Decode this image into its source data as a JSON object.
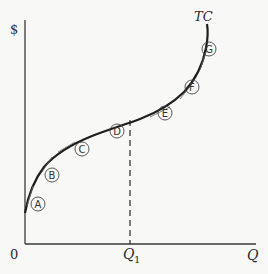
{
  "diagram": {
    "type": "total-cost-curve",
    "y_axis_label": "$",
    "x_axis_label": "Q",
    "origin_label": "0",
    "curve_label": "TC",
    "q1_label": "Q",
    "q1_subscript": "1",
    "points": [
      {
        "id": "A",
        "label": "A"
      },
      {
        "id": "B",
        "label": "B"
      },
      {
        "id": "C",
        "label": "C"
      },
      {
        "id": "D",
        "label": "D"
      },
      {
        "id": "E",
        "label": "E"
      },
      {
        "id": "F",
        "label": "F"
      },
      {
        "id": "G",
        "label": "G"
      }
    ],
    "colors": {
      "background": "#f8f8f6",
      "axis": "#3a3a3a",
      "curve": "#1e1e1e",
      "dashed": "#2a2a2a"
    }
  }
}
